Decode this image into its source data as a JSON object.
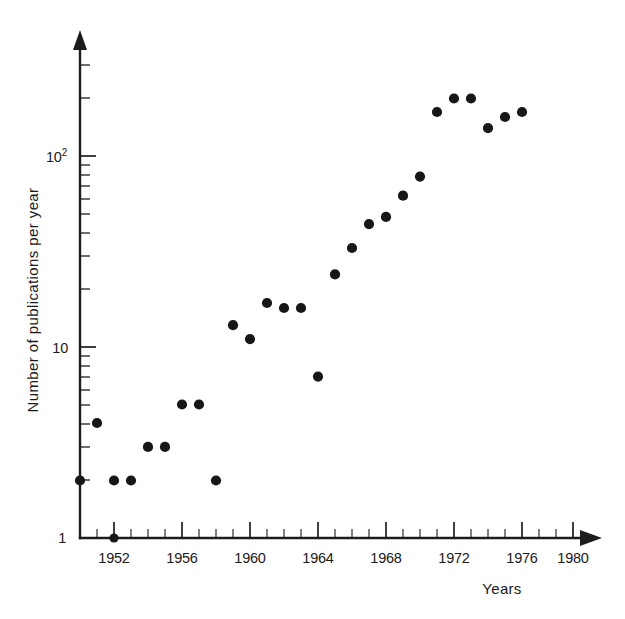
{
  "chart_data": {
    "type": "scatter",
    "title": "",
    "xlabel": "Years",
    "ylabel": "Number of publications per year",
    "yscale": "log",
    "xlim": [
      1950,
      1981
    ],
    "ylim": [
      1,
      300
    ],
    "grid": false,
    "legend": null,
    "x_tick_labels": [
      "1952",
      "1956",
      "1960",
      "1964",
      "1968",
      "1972",
      "1976",
      "1980"
    ],
    "x_tick_values": [
      1952,
      1956,
      1960,
      1964,
      1968,
      1972,
      1976,
      1980
    ],
    "x_minor_tick_step": 1,
    "y_tick_labels": [
      "1",
      "10",
      "10²"
    ],
    "y_tick_values": [
      1,
      10,
      100
    ],
    "marker": "filled-circle",
    "marker_color": "#171717",
    "series": [
      {
        "name": "publications",
        "x": [
          1950,
          1951,
          1952,
          1953,
          1954,
          1955,
          1956,
          1957,
          1958,
          1959,
          1960,
          1961,
          1962,
          1963,
          1964,
          1965,
          1966,
          1967,
          1968,
          1969,
          1970,
          1971,
          1972,
          1973,
          1974,
          1975,
          1976
        ],
        "values": [
          2,
          4,
          2,
          2,
          3,
          3,
          5,
          5,
          2,
          13,
          11,
          17,
          16,
          16,
          7,
          24,
          33,
          44,
          48,
          62,
          78,
          170,
          200,
          200,
          140,
          160,
          170
        ]
      }
    ],
    "annotations": [
      {
        "name": "origin-marker",
        "x": 1952,
        "y": 1,
        "note": "filled dot on axis at 1952 baseline"
      }
    ]
  },
  "axis": {
    "y_label_text": "Number of publications per year",
    "x_label_text": "Years",
    "y_base_label": "1",
    "y_decade_label": "10",
    "y_hundred_mantissa": "10",
    "y_hundred_exponent": "2"
  },
  "colors": {
    "background": "#ffffff",
    "ink": "#1a1a1a",
    "marker": "#171717"
  }
}
